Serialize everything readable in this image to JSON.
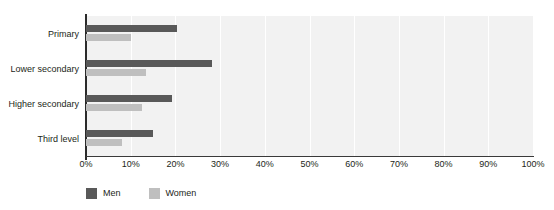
{
  "chart_data": {
    "type": "bar",
    "orientation": "horizontal",
    "title": "",
    "xlabel": "",
    "ylabel": "",
    "categories": [
      "Primary",
      "Lower secondary",
      "Higher secondary",
      "Third level"
    ],
    "series": [
      {
        "name": "Men",
        "color": "#595959",
        "values": [
          20.4,
          28.2,
          19.2,
          15.0
        ]
      },
      {
        "name": "Women",
        "color": "#bfbfbf",
        "values": [
          10.0,
          13.5,
          12.5,
          8.0
        ]
      }
    ],
    "xlim": [
      0,
      100
    ],
    "xticks": [
      "0%",
      "10%",
      "20%",
      "30%",
      "40%",
      "50%",
      "60%",
      "70%",
      "80%",
      "90%",
      "100%"
    ],
    "xtick_values": [
      0,
      10,
      20,
      30,
      40,
      50,
      60,
      70,
      80,
      90,
      100
    ],
    "grid": true,
    "grid_axis": "x",
    "legend_position": "bottom-left",
    "plot_background": "#f2f2f2",
    "gridline_color": "#ffffff",
    "axis_color": "#2b2b2b",
    "text_color": "#231f20"
  },
  "legend": {
    "items": [
      {
        "label": "Men",
        "color": "#595959"
      },
      {
        "label": "Women",
        "color": "#bfbfbf"
      }
    ]
  }
}
